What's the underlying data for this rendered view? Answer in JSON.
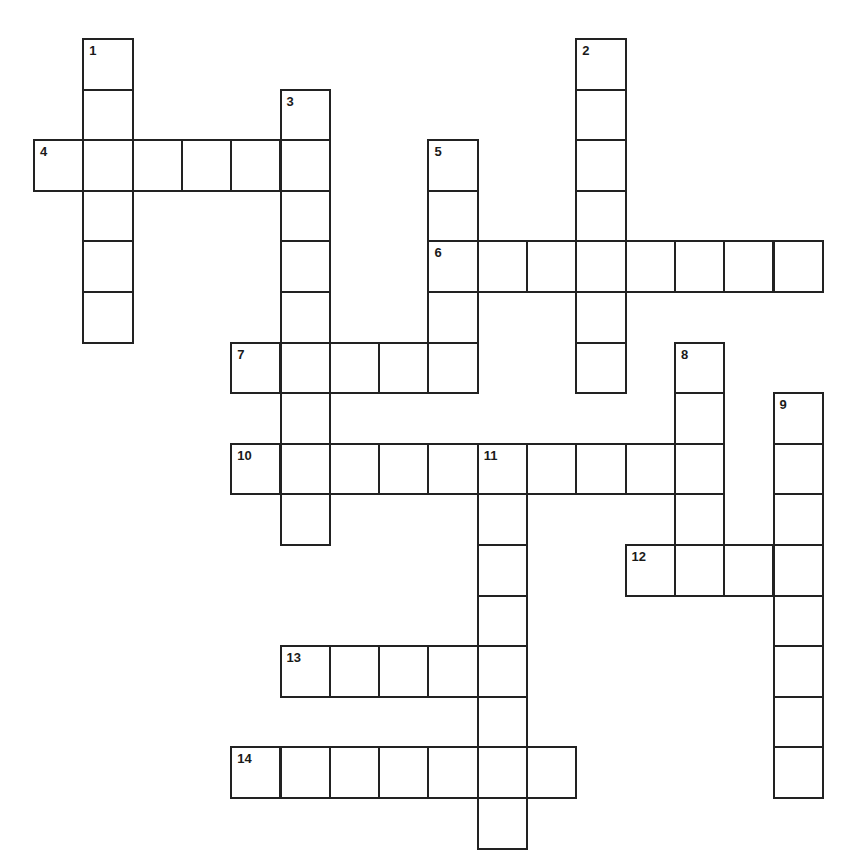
{
  "puzzle": {
    "type": "crossword",
    "grid_layout": {
      "origin_x": 34,
      "origin_y": 39,
      "cell_w": 49.3,
      "cell_h": 50.6
    },
    "colors": {
      "line": "#222222",
      "cell_bg": "#ffffff",
      "number": "#1a1a1a"
    },
    "entries": [
      {
        "number": "1",
        "direction": "down",
        "row": 0,
        "col": 1,
        "length": 6
      },
      {
        "number": "2",
        "direction": "down",
        "row": 0,
        "col": 11,
        "length": 7
      },
      {
        "number": "3",
        "direction": "down",
        "row": 1,
        "col": 5,
        "length": 9
      },
      {
        "number": "4",
        "direction": "across",
        "row": 2,
        "col": 0,
        "length": 6
      },
      {
        "number": "5",
        "direction": "down",
        "row": 2,
        "col": 8,
        "length": 5
      },
      {
        "number": "6",
        "direction": "across",
        "row": 4,
        "col": 8,
        "length": 8
      },
      {
        "number": "7",
        "direction": "across",
        "row": 6,
        "col": 4,
        "length": 5
      },
      {
        "number": "8",
        "direction": "down",
        "row": 6,
        "col": 13,
        "length": 5
      },
      {
        "number": "9",
        "direction": "down",
        "row": 7,
        "col": 15,
        "length": 8
      },
      {
        "number": "10",
        "direction": "across",
        "row": 8,
        "col": 4,
        "length": 10
      },
      {
        "number": "11",
        "direction": "down",
        "row": 8,
        "col": 9,
        "length": 8
      },
      {
        "number": "12",
        "direction": "across",
        "row": 10,
        "col": 12,
        "length": 4
      },
      {
        "number": "13",
        "direction": "across",
        "row": 12,
        "col": 5,
        "length": 5
      },
      {
        "number": "14",
        "direction": "across",
        "row": 14,
        "col": 4,
        "length": 7
      }
    ]
  }
}
